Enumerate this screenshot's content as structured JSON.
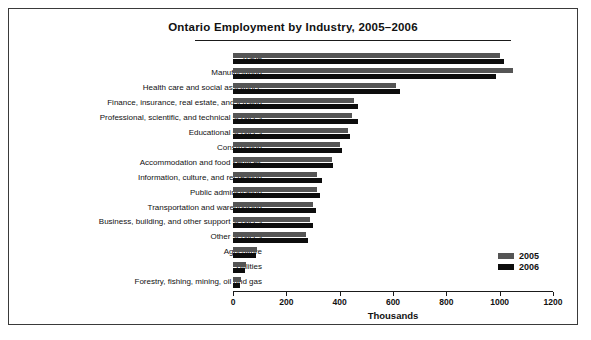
{
  "chart_data": {
    "type": "bar",
    "orientation": "horizontal",
    "title": "Ontario Employment by Industry, 2005–2006",
    "xlabel": "Thousands",
    "ylabel": "",
    "xlim": [
      0,
      1200
    ],
    "xticks": [
      0,
      200,
      400,
      600,
      800,
      1000,
      1200
    ],
    "grid": false,
    "legend_position": "right-lower",
    "categories": [
      "Trade",
      "Manufacturing",
      "Health care and social assistance",
      "Finance, insurance, real estate, and leasing",
      "Professional, scientific, and technical services",
      "Educational services",
      "Construction",
      "Accommodation and food services",
      "Information, culture, and recreation",
      "Public adminstration",
      "Transportation and warehousing",
      "Business, building, and other support services",
      "Other services",
      "Agriculture",
      "Utilities",
      "Forestry, fishing, mining, oil and gas"
    ],
    "series": [
      {
        "name": "2005",
        "color": "#555555",
        "values": [
          1000,
          1050,
          610,
          455,
          445,
          430,
          400,
          370,
          315,
          315,
          300,
          290,
          275,
          90,
          50,
          30
        ]
      },
      {
        "name": "2006",
        "color": "#0d0d0d",
        "values": [
          1015,
          985,
          625,
          470,
          470,
          440,
          410,
          375,
          335,
          325,
          310,
          300,
          280,
          85,
          45,
          28
        ]
      }
    ]
  },
  "legend": {
    "entries": [
      {
        "label": "2005",
        "color": "#555555"
      },
      {
        "label": "2006",
        "color": "#0d0d0d"
      }
    ]
  }
}
